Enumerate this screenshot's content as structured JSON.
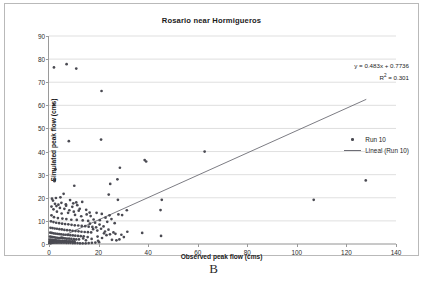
{
  "caption": "B",
  "chart_data": {
    "type": "scatter",
    "title": "Rosario near Hormigueros",
    "xlabel": "Observed peak flow (cms)",
    "ylabel": "Simulated peak flow (cms)",
    "xlim": [
      0,
      140
    ],
    "ylim": [
      0,
      90
    ],
    "xticks": [
      0,
      20,
      40,
      60,
      80,
      100,
      120,
      140
    ],
    "yticks": [
      0,
      10,
      20,
      30,
      40,
      50,
      60,
      70,
      80,
      90
    ],
    "grid": "horizontal",
    "legend_position": "right",
    "series": [
      {
        "name": "Run 10",
        "type": "scatter",
        "marker_color": "#4a4a52",
        "points": [
          [
            2.0,
            76.4
          ],
          [
            7.1,
            77.8
          ],
          [
            11.0,
            75.9
          ],
          [
            21.2,
            66.2
          ],
          [
            2.0,
            60.3
          ],
          [
            8.0,
            44.5
          ],
          [
            21.0,
            45.2
          ],
          [
            62.8,
            40.0
          ],
          [
            38.6,
            36.3
          ],
          [
            39.2,
            35.7
          ],
          [
            28.6,
            33.0
          ],
          [
            2.6,
            32.3
          ],
          [
            2.3,
            27.8
          ],
          [
            2.2,
            27.2
          ],
          [
            127.8,
            27.5
          ],
          [
            24.7,
            26.0
          ],
          [
            27.6,
            28.0
          ],
          [
            10.2,
            25.2
          ],
          [
            24.1,
            21.4
          ],
          [
            5.9,
            21.7
          ],
          [
            1.2,
            19.6
          ],
          [
            1.6,
            18.8
          ],
          [
            2.8,
            19.9
          ],
          [
            27.8,
            19.1
          ],
          [
            45.5,
            19.1
          ],
          [
            106.8,
            19.1
          ],
          [
            4.6,
            20.2
          ],
          [
            8.5,
            19.0
          ],
          [
            11.0,
            18.0
          ],
          [
            13.4,
            18.2
          ],
          [
            6.9,
            16.6
          ],
          [
            9.4,
            16.1
          ],
          [
            12.4,
            15.2
          ],
          [
            15.0,
            14.8
          ],
          [
            31.4,
            14.6
          ],
          [
            45.0,
            14.7
          ],
          [
            19.2,
            13.5
          ],
          [
            21.3,
            13.0
          ],
          [
            28.0,
            12.8
          ],
          [
            29.5,
            12.5
          ],
          [
            24.4,
            12.4
          ],
          [
            16.8,
            12.1
          ],
          [
            3.2,
            14.0
          ],
          [
            5.1,
            13.2
          ],
          [
            7.7,
            13.5
          ],
          [
            10.5,
            12.6
          ],
          [
            13.0,
            12.0
          ],
          [
            1.0,
            12.4
          ],
          [
            2.0,
            11.6
          ],
          [
            3.6,
            11.2
          ],
          [
            5.4,
            11.0
          ],
          [
            7.0,
            10.8
          ],
          [
            9.0,
            10.5
          ],
          [
            11.2,
            10.4
          ],
          [
            13.6,
            10.2
          ],
          [
            15.8,
            10.0
          ],
          [
            18.0,
            10.6
          ],
          [
            20.5,
            10.3
          ],
          [
            22.8,
            11.4
          ],
          [
            0.8,
            9.8
          ],
          [
            1.8,
            9.5
          ],
          [
            2.9,
            9.2
          ],
          [
            4.1,
            9.0
          ],
          [
            5.3,
            8.8
          ],
          [
            6.5,
            8.6
          ],
          [
            7.8,
            8.5
          ],
          [
            9.1,
            8.3
          ],
          [
            10.4,
            8.1
          ],
          [
            11.8,
            8.0
          ],
          [
            13.2,
            7.8
          ],
          [
            14.6,
            7.7
          ],
          [
            16.0,
            7.5
          ],
          [
            17.5,
            7.4
          ],
          [
            19.0,
            7.2
          ],
          [
            0.6,
            7.0
          ],
          [
            1.4,
            6.9
          ],
          [
            2.3,
            6.7
          ],
          [
            3.2,
            6.6
          ],
          [
            4.2,
            6.4
          ],
          [
            5.2,
            6.3
          ],
          [
            6.2,
            6.1
          ],
          [
            7.3,
            6.0
          ],
          [
            8.4,
            5.9
          ],
          [
            9.5,
            5.7
          ],
          [
            10.7,
            5.6
          ],
          [
            11.9,
            5.5
          ],
          [
            13.1,
            5.3
          ],
          [
            14.4,
            5.2
          ],
          [
            15.7,
            5.1
          ],
          [
            17.0,
            5.0
          ],
          [
            0.5,
            4.9
          ],
          [
            1.1,
            4.8
          ],
          [
            1.8,
            4.6
          ],
          [
            2.5,
            4.5
          ],
          [
            3.3,
            4.4
          ],
          [
            4.1,
            4.3
          ],
          [
            4.9,
            4.2
          ],
          [
            5.8,
            4.1
          ],
          [
            6.7,
            4.0
          ],
          [
            7.6,
            3.9
          ],
          [
            8.6,
            3.8
          ],
          [
            9.6,
            3.7
          ],
          [
            10.6,
            3.6
          ],
          [
            11.7,
            3.5
          ],
          [
            12.8,
            3.4
          ],
          [
            14.0,
            3.3
          ],
          [
            0.4,
            3.2
          ],
          [
            0.9,
            3.1
          ],
          [
            1.5,
            3.0
          ],
          [
            2.1,
            2.9
          ],
          [
            2.7,
            2.8
          ],
          [
            3.4,
            2.7
          ],
          [
            4.1,
            2.6
          ],
          [
            4.8,
            2.6
          ],
          [
            5.6,
            2.5
          ],
          [
            6.4,
            2.4
          ],
          [
            7.2,
            2.3
          ],
          [
            8.1,
            2.3
          ],
          [
            9.0,
            2.2
          ],
          [
            10.0,
            2.1
          ],
          [
            11.0,
            2.0
          ],
          [
            12.1,
            2.0
          ],
          [
            0.3,
            1.9
          ],
          [
            0.7,
            1.8
          ],
          [
            1.2,
            1.8
          ],
          [
            1.7,
            1.7
          ],
          [
            2.2,
            1.6
          ],
          [
            2.8,
            1.6
          ],
          [
            3.4,
            1.5
          ],
          [
            4.0,
            1.5
          ],
          [
            4.7,
            1.4
          ],
          [
            5.4,
            1.4
          ],
          [
            6.1,
            1.3
          ],
          [
            6.9,
            1.3
          ],
          [
            7.7,
            1.2
          ],
          [
            8.5,
            1.2
          ],
          [
            9.4,
            1.1
          ],
          [
            10.3,
            1.1
          ],
          [
            0.2,
            1.0
          ],
          [
            0.5,
            1.0
          ],
          [
            0.9,
            0.9
          ],
          [
            1.3,
            0.9
          ],
          [
            1.7,
            0.8
          ],
          [
            2.2,
            0.8
          ],
          [
            2.7,
            0.8
          ],
          [
            3.2,
            0.7
          ],
          [
            3.8,
            0.7
          ],
          [
            4.4,
            0.7
          ],
          [
            5.0,
            0.6
          ],
          [
            5.7,
            0.6
          ],
          [
            6.4,
            0.6
          ],
          [
            7.1,
            0.5
          ],
          [
            7.9,
            0.5
          ],
          [
            8.7,
            0.5
          ],
          [
            9.6,
            0.4
          ],
          [
            10.5,
            0.4
          ],
          [
            11.5,
            0.4
          ],
          [
            12.5,
            0.3
          ],
          [
            13.6,
            0.3
          ],
          [
            14.8,
            0.3
          ],
          [
            16.0,
            0.4
          ],
          [
            17.3,
            0.5
          ],
          [
            18.7,
            0.6
          ],
          [
            20.2,
            0.8
          ],
          [
            0.15,
            0.3
          ],
          [
            0.35,
            0.35
          ],
          [
            0.6,
            0.4
          ],
          [
            0.85,
            0.45
          ],
          [
            1.1,
            0.5
          ],
          [
            1.4,
            0.55
          ],
          [
            1.9,
            0.6
          ],
          [
            2.4,
            0.65
          ],
          [
            3.0,
            0.7
          ],
          [
            3.6,
            0.75
          ],
          [
            4.3,
            0.8
          ],
          [
            5.1,
            0.85
          ],
          [
            6.0,
            0.9
          ],
          [
            7.0,
            0.95
          ],
          [
            8.2,
            1.0
          ],
          [
            9.5,
            1.05
          ],
          [
            16.5,
            8.8
          ],
          [
            18.6,
            9.2
          ],
          [
            20.4,
            8.4
          ],
          [
            22.0,
            7.6
          ],
          [
            23.5,
            9.6
          ],
          [
            25.2,
            10.8
          ],
          [
            26.5,
            9.0
          ],
          [
            17.8,
            6.4
          ],
          [
            19.5,
            5.8
          ],
          [
            21.0,
            6.6
          ],
          [
            22.6,
            5.4
          ],
          [
            24.0,
            6.2
          ],
          [
            15.2,
            12.8
          ],
          [
            16.4,
            13.6
          ],
          [
            12.0,
            14.4
          ],
          [
            10.0,
            14.0
          ],
          [
            8.2,
            14.6
          ],
          [
            6.2,
            15.2
          ],
          [
            4.4,
            15.6
          ],
          [
            3.0,
            16.4
          ],
          [
            1.8,
            15.0
          ],
          [
            1.0,
            16.2
          ],
          [
            2.4,
            17.4
          ],
          [
            3.8,
            17.0
          ],
          [
            5.0,
            17.8
          ],
          [
            6.8,
            17.2
          ],
          [
            9.8,
            17.6
          ],
          [
            11.4,
            16.8
          ],
          [
            19.6,
            3.2
          ],
          [
            21.4,
            2.6
          ],
          [
            23.2,
            3.8
          ],
          [
            25.4,
            1.8
          ],
          [
            27.2,
            1.6
          ],
          [
            28.4,
            2.0
          ],
          [
            31.6,
            5.3
          ],
          [
            37.6,
            4.8
          ],
          [
            45.2,
            3.5
          ],
          [
            19.8,
            1.4
          ],
          [
            17.2,
            2.2
          ],
          [
            14.9,
            1.6
          ],
          [
            26.8,
            4.4
          ],
          [
            29.2,
            4.0
          ],
          [
            15.6,
            3.0
          ],
          [
            13.8,
            2.4
          ],
          [
            22.2,
            4.6
          ],
          [
            24.6,
            4.2
          ],
          [
            26.0,
            5.0
          ],
          [
            30.2,
            3.0
          ]
        ]
      },
      {
        "name": "Lineal (Run 10)",
        "type": "line",
        "line_color": "#6d6d75",
        "equation": "y = 0.483x + 0.7736",
        "slope": 0.483,
        "intercept": 0.7736,
        "r_squared": 0.301,
        "x_start": 0,
        "x_end": 128
      }
    ],
    "annotations": {
      "equation": "y = 0.483x + 0.7736",
      "r2_prefix": "R",
      "r2_sup": "2",
      "r2_value": " = 0.301"
    }
  }
}
